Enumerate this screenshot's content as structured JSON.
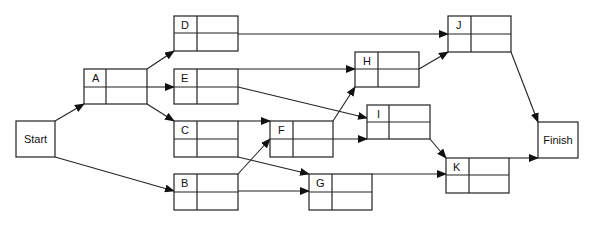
{
  "diagram": {
    "type": "activity-on-node network",
    "terminals": {
      "start": {
        "label": "Start"
      },
      "finish": {
        "label": "Finish"
      }
    },
    "nodes": {
      "A": {
        "label": "A"
      },
      "B": {
        "label": "B"
      },
      "C": {
        "label": "C"
      },
      "D": {
        "label": "D"
      },
      "E": {
        "label": "E"
      },
      "F": {
        "label": "F"
      },
      "G": {
        "label": "G"
      },
      "H": {
        "label": "H"
      },
      "I": {
        "label": "I"
      },
      "J": {
        "label": "J"
      },
      "K": {
        "label": "K"
      }
    },
    "edges": [
      [
        "Start",
        "A"
      ],
      [
        "Start",
        "B"
      ],
      [
        "A",
        "D"
      ],
      [
        "A",
        "E"
      ],
      [
        "A",
        "C"
      ],
      [
        "D",
        "J"
      ],
      [
        "E",
        "H"
      ],
      [
        "E",
        "I"
      ],
      [
        "C",
        "F"
      ],
      [
        "C",
        "G"
      ],
      [
        "B",
        "F"
      ],
      [
        "B",
        "G"
      ],
      [
        "F",
        "H"
      ],
      [
        "F",
        "I"
      ],
      [
        "H",
        "J"
      ],
      [
        "I",
        "K"
      ],
      [
        "G",
        "K"
      ],
      [
        "J",
        "Finish"
      ],
      [
        "K",
        "Finish"
      ]
    ]
  }
}
